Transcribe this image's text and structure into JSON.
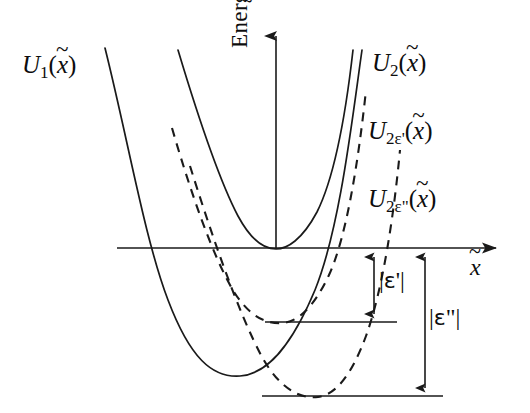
{
  "figure": {
    "type": "energy-potential-diagram",
    "background_color": "#ffffff",
    "stroke_color": "#1a1a1a",
    "axes": {
      "y_axis_label": "Energy",
      "x_axis_label_base": "x",
      "x_axis_label_accent": "~",
      "origin": {
        "x": 276,
        "y": 248
      },
      "x_axis_start_x": 117,
      "x_axis_end_x": 502,
      "y_axis_top_y": 30
    },
    "curves": [
      {
        "id": "U1",
        "style": "solid",
        "label_base": "U",
        "label_sub": "1",
        "label_arg": "x",
        "label_accent": "~",
        "vertex": {
          "x": 240,
          "y": 375
        }
      },
      {
        "id": "U2",
        "style": "solid",
        "label_base": "U",
        "label_sub": "2",
        "label_arg": "x",
        "label_accent": "~",
        "vertex": {
          "x": 276,
          "y": 248
        }
      },
      {
        "id": "U2eps1",
        "style": "dashed",
        "label_base": "U",
        "label_sub": "2ε'",
        "label_arg": "x",
        "label_accent": "~",
        "vertex": {
          "x": 281,
          "y": 322
        }
      },
      {
        "id": "U2eps2",
        "style": "dashed",
        "label_base": "U",
        "label_sub": "2ε\"",
        "label_arg": "x",
        "label_accent": "~",
        "vertex": {
          "x": 318,
          "y": 396
        }
      }
    ],
    "level_lines": [
      {
        "id": "level-eps1",
        "y": 322,
        "x_start": 265,
        "x_end": 397
      },
      {
        "id": "level-eps2",
        "y": 396,
        "x_start": 262,
        "x_end": 443
      }
    ],
    "measures": [
      {
        "id": "eps1",
        "label_bar_open": "|",
        "label_symbol": "ε",
        "label_prime": "'",
        "label_bar_close": "|",
        "arrow_x": 374,
        "y_top": 249,
        "y_bottom": 322
      },
      {
        "id": "eps2",
        "label_bar_open": "|",
        "label_symbol": "ε",
        "label_prime": "\"",
        "label_bar_close": "|",
        "arrow_x": 425,
        "y_top": 249,
        "y_bottom": 396
      }
    ]
  }
}
